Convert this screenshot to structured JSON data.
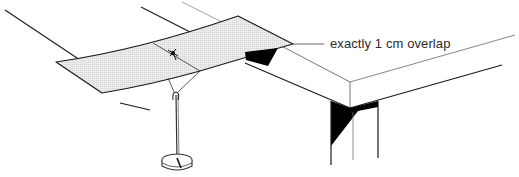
{
  "diagram": {
    "type": "technical-illustration",
    "annotation": {
      "text": "exactly 1 cm overlap",
      "x": 330,
      "y": 36
    },
    "elements": [
      {
        "name": "paper-strip",
        "fill": "#e6e6e6"
      },
      {
        "name": "table-top-corner"
      },
      {
        "name": "table-leg"
      },
      {
        "name": "hanging-weight"
      },
      {
        "name": "support-rods"
      },
      {
        "name": "string-knot"
      }
    ],
    "colors": {
      "line": "#1a1a1a",
      "thin_line": "#555555",
      "shadow": "#000000",
      "paper": "#e4e4e4",
      "background": "#ffffff"
    }
  }
}
